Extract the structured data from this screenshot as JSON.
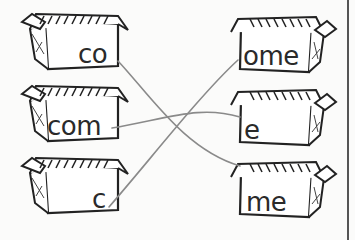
{
  "activity": {
    "type": "word-part matching",
    "left_boxes": [
      {
        "id": "left-1",
        "text": "co"
      },
      {
        "id": "left-2",
        "text": "com"
      },
      {
        "id": "left-3",
        "text": "c"
      }
    ],
    "right_boxes": [
      {
        "id": "right-1",
        "text": "ome"
      },
      {
        "id": "right-2",
        "text": "e"
      },
      {
        "id": "right-3",
        "text": "me"
      }
    ],
    "connections": [
      {
        "from": "co",
        "to": "me"
      },
      {
        "from": "com",
        "to": "e"
      },
      {
        "from": "c",
        "to": "ome"
      }
    ],
    "colors": {
      "ink": "#222222",
      "line": "#8a8a8a",
      "background": "#fbfbfa"
    }
  }
}
